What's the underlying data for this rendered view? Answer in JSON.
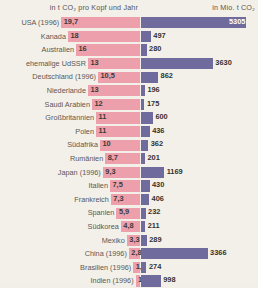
{
  "header": {
    "left_title": "in t CO₂ pro Kopf und Jahr",
    "right_title": "in Mio. t CO₂"
  },
  "colors": {
    "per_capita_bar": "#eda0ac",
    "total_bar": "#6f6b9c",
    "background": "#f3f0ea",
    "label_text": "#5b5854"
  },
  "chart_data": {
    "type": "bar",
    "title": "",
    "xlabel": "",
    "ylabel": "",
    "grid": false,
    "legend_position": "none",
    "orientation": "horizontal",
    "categories": [
      "USA (1996)",
      "Kanada",
      "Australien",
      "ehemalige UdSSR",
      "Deutschland (1996)",
      "Niederlande",
      "Saudi Arabien",
      "Großbritannien",
      "Polen",
      "Südafrika",
      "Rumänien",
      "Japan (1996)",
      "Italien",
      "Frankreich",
      "Spanien",
      "Südkorea",
      "Mexiko",
      "China (1996)",
      "Brasilien (1996)",
      "Indien (1996)"
    ],
    "series": [
      {
        "name": "in t CO2 pro Kopf und Jahr",
        "unit": "t CO2 pro Kopf und Jahr",
        "color": "#eda0ac",
        "values": [
          19.7,
          18,
          16,
          13,
          10.5,
          13,
          12,
          11,
          11,
          10,
          8.7,
          9.3,
          7.5,
          7.3,
          5.9,
          4.8,
          3.3,
          2.8,
          1.7,
          1.1
        ],
        "labels": [
          "19,7",
          "18",
          "16",
          "13",
          "10,5",
          "13",
          "12",
          "11",
          "11",
          "10",
          "8,7",
          "9,3",
          "7,5",
          "7,3",
          "5,9",
          "4,8",
          "3,3",
          "2,8",
          "1,7",
          "1,1"
        ]
      },
      {
        "name": "in Mio. t CO2",
        "unit": "Mio. t CO2",
        "color": "#6f6b9c",
        "values": [
          5305,
          497,
          280,
          3630,
          862,
          196,
          175,
          600,
          436,
          362,
          201,
          1169,
          430,
          406,
          232,
          211,
          289,
          3366,
          274,
          998
        ],
        "labels": [
          "5305",
          "497",
          "280",
          "3630",
          "862",
          "196",
          "175",
          "600",
          "436",
          "362",
          "201",
          "1169",
          "430",
          "406",
          "232",
          "211",
          "289",
          "3366",
          "274",
          "998"
        ]
      }
    ]
  }
}
